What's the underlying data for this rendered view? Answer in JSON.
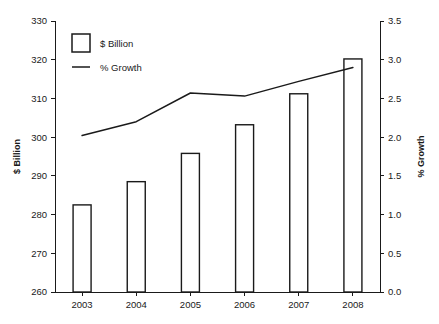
{
  "chart_data": {
    "type": "bar",
    "title": "",
    "subtitle": "",
    "xlabel": "",
    "ylabel": "$ Billion",
    "y2label": "% Growth",
    "categories": [
      "2003",
      "2004",
      "2005",
      "2006",
      "2007",
      "2008"
    ],
    "ylim": [
      260,
      330
    ],
    "y2lim": [
      0.0,
      3.5
    ],
    "yticks": [
      "260",
      "270",
      "280",
      "290",
      "300",
      "310",
      "320",
      "330"
    ],
    "ytick_values": [
      260,
      270,
      280,
      290,
      300,
      310,
      320,
      330
    ],
    "y2ticks": [
      "0.0",
      "0.5",
      "1.0",
      "1.5",
      "2.0",
      "2.5",
      "3.0",
      "3.5"
    ],
    "y2tick_values": [
      0.0,
      0.5,
      1.0,
      1.5,
      2.0,
      2.5,
      3.0,
      3.5
    ],
    "grid": false,
    "legend_position": "top-left",
    "series": [
      {
        "name": "$ Billion",
        "type": "bar",
        "axis": "left",
        "values": [
          282.5,
          288.5,
          295.8,
          303.2,
          311.2,
          320.2
        ]
      },
      {
        "name": "% Growth",
        "type": "line",
        "axis": "right",
        "values": [
          2.02,
          2.2,
          2.57,
          2.53,
          2.72,
          2.9
        ]
      }
    ]
  },
  "legend": {
    "items": [
      {
        "label": "$ Billion",
        "marker": "open-square"
      },
      {
        "label": "% Growth",
        "marker": "line"
      }
    ]
  },
  "colors": {
    "ink": "#1a1a1a",
    "background": "#ffffff",
    "bar_fill": "#ffffff",
    "bar_stroke": "#1a1a1a",
    "line_stroke": "#1a1a1a"
  }
}
